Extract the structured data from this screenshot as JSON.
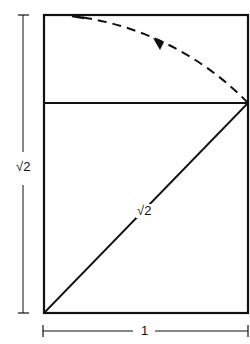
{
  "diagram": {
    "title": "",
    "labels": {
      "height_label": "√2",
      "diagonal_label": "√2",
      "width_label": "1"
    },
    "colors": {
      "stroke": "#111111",
      "background": "#ffffff"
    },
    "elements": [
      "outer-rectangle",
      "inner-square-top-line",
      "diagonal",
      "dashed-arc-with-arrow",
      "height-dimension-line",
      "width-dimension-line"
    ]
  }
}
